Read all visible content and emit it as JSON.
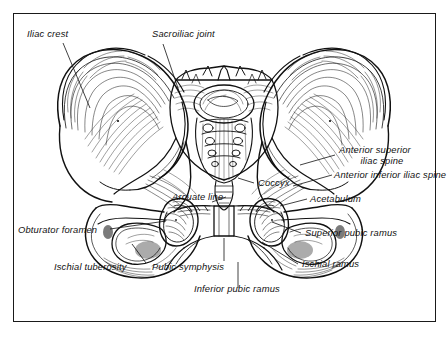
{
  "figure": {
    "view": "anterior",
    "frame": {
      "border_color": "#1a1a1a",
      "background": "#ffffff"
    },
    "ink_color": "#111111",
    "label_style": "italic"
  },
  "labels": [
    {
      "id": "iliac-crest",
      "text": "Iliac crest"
    },
    {
      "id": "sacroiliac-joint",
      "text": "Sacroiliac joint"
    },
    {
      "id": "anterior-superior-iliac-spine-1",
      "text": "Anterior superior"
    },
    {
      "id": "anterior-superior-iliac-spine-2",
      "text": "iliac spine"
    },
    {
      "id": "anterior-inferior-iliac-spine",
      "text": "Anterior inferior iliac spine"
    },
    {
      "id": "acetabulum",
      "text": "Acetabulum"
    },
    {
      "id": "superior-pubic-ramus",
      "text": "Superior pubic ramus"
    },
    {
      "id": "ischial-ramus",
      "text": "Ischial ramus"
    },
    {
      "id": "coccyx",
      "text": "Coccyx"
    },
    {
      "id": "arcuate-line",
      "text": "Arcuate line"
    },
    {
      "id": "obturator-foramen",
      "text": "Obturator foramen"
    },
    {
      "id": "ischial-tuberosity",
      "text": "Ischial tuberosity"
    },
    {
      "id": "pubic-symphysis",
      "text": "Pubic symphysis"
    },
    {
      "id": "inferior-pubic-ramus",
      "text": "Inferior pubic ramus"
    }
  ],
  "structures": [
    "ilium-left",
    "ilium-right",
    "sacrum",
    "coccyx",
    "acetabulum-left",
    "acetabulum-right",
    "obturator-foramen-left",
    "obturator-foramen-right",
    "pubic-symphysis",
    "ischial-tuberosity-left",
    "ischial-tuberosity-right"
  ]
}
